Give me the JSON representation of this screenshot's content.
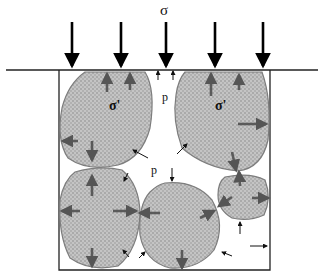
{
  "diagram": {
    "title_symbol": "σ",
    "labels": {
      "pore_pressure_top": "p",
      "pore_pressure_mid": "p",
      "effective_stress_left": "σ'",
      "effective_stress_right": "σ'"
    },
    "colors": {
      "particle_fill": "#b8b8b8",
      "particle_stroke": "#808080",
      "force_arrow": "#666666",
      "load_arrow": "#000000"
    }
  }
}
